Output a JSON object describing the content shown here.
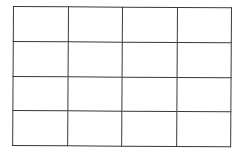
{
  "grid": {
    "rows": 4,
    "columns": 4,
    "line_color": "#3a3a3a",
    "background_color": "#ffffff",
    "cells": [
      [
        "",
        "",
        "",
        ""
      ],
      [
        "",
        "",
        "",
        ""
      ],
      [
        "",
        "",
        "",
        ""
      ],
      [
        "",
        "",
        "",
        ""
      ]
    ]
  }
}
